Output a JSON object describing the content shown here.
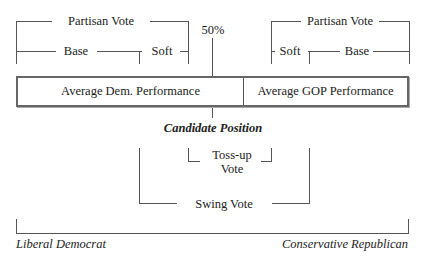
{
  "diagram": {
    "left_partisan": {
      "title": "Partisan Vote",
      "base": "Base",
      "soft": "Soft"
    },
    "right_partisan": {
      "title": "Partisan Vote",
      "base": "Base",
      "soft": "Soft"
    },
    "midpoint_label": "50%",
    "bar": {
      "dem_label": "Average Dem. Performance",
      "gop_label": "Average GOP Performance"
    },
    "candidate_position_label": "Candidate Position",
    "tossup_label_line1": "Toss-up",
    "tossup_label_line2": "Vote",
    "swing_label": "Swing Vote",
    "axis": {
      "left_label": "Liberal Democrat",
      "right_label": "Conservative Republican"
    }
  }
}
